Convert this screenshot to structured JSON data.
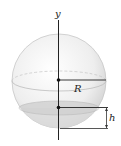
{
  "figure": {
    "labels": {
      "axis": "y",
      "radius": "R",
      "height": "h"
    },
    "colors": {
      "sphere_fill": "#f0f0f0",
      "sphere_stroke": "#c8c8c8",
      "cap_fill": "#d6d6d6",
      "lines": "#222222"
    }
  }
}
